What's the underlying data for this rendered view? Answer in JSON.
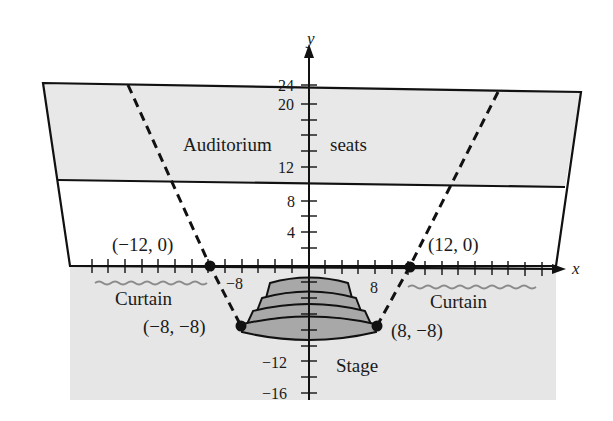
{
  "axes": {
    "x_label": "x",
    "y_label": "y",
    "y_ticks": [
      {
        "value": 24,
        "label": "24"
      },
      {
        "value": 20,
        "label": "20"
      },
      {
        "value": 12,
        "label": "12"
      },
      {
        "value": 8,
        "label": "8"
      },
      {
        "value": 4,
        "label": "4"
      },
      {
        "value": -12,
        "label": "−12"
      },
      {
        "value": -16,
        "label": "−16"
      }
    ],
    "x_ticks_labeled": [
      {
        "value": -8,
        "label": "−8"
      },
      {
        "value": 8,
        "label": "8"
      }
    ]
  },
  "regions": {
    "seats_left": "Auditorium",
    "seats_right": "seats",
    "curtain_left": "Curtain",
    "curtain_right": "Curtain",
    "stage": "Stage"
  },
  "points": [
    {
      "x": -12,
      "y": 0,
      "label": "(−12, 0)"
    },
    {
      "x": 12,
      "y": 0,
      "label": "(12, 0)"
    },
    {
      "x": -8,
      "y": -8,
      "label": "(−8, −8)"
    },
    {
      "x": 8,
      "y": -8,
      "label": "(8, −8)"
    }
  ],
  "colors": {
    "seat_fill": "#e8e8e8",
    "stage_fill": "#e6e6e6",
    "steps_fill": "#a8a8a8",
    "line": "#111111",
    "curtain_wave": "#8a8a8a"
  }
}
